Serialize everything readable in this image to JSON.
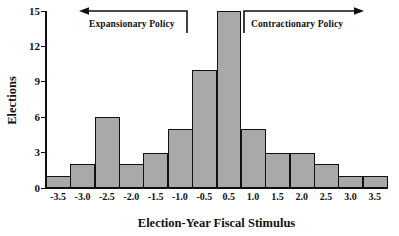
{
  "chart_data": {
    "type": "bar",
    "title": "",
    "subtitle": "",
    "xlabel": "Election-Year Fiscal Stimulus",
    "ylabel": "Elections",
    "categories": [
      "-3.5",
      "-3.0",
      "-2.5",
      "-2.0",
      "-1.5",
      "-1.0",
      "-0.5",
      "0.5",
      "1.0",
      "1.5",
      "2.0",
      "2.5",
      "3.0",
      "3.5"
    ],
    "values": [
      1,
      2,
      6,
      2,
      3,
      5,
      10,
      15,
      5,
      3,
      3,
      2,
      1,
      1
    ],
    "ylim": [
      0,
      15
    ],
    "yticks": [
      0,
      3,
      6,
      9,
      12,
      15
    ],
    "ytick_labels": [
      "0",
      "3",
      "6",
      "9",
      "12",
      "15"
    ],
    "grid": false,
    "legend": null,
    "bar_color": "#a9a9a9",
    "bar_edge_color": "#111111",
    "axis_color": "#111111",
    "annotations": [
      {
        "id": "expansionary",
        "text": "Expansionary Policy",
        "direction": "left"
      },
      {
        "id": "contractionary",
        "text": "Contractionary Policy",
        "direction": "right"
      }
    ]
  }
}
